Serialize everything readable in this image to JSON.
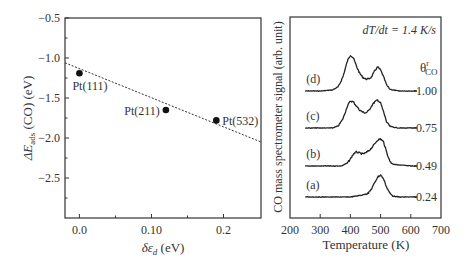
{
  "chart_data": [
    {
      "type": "scatter",
      "panel": "left",
      "title": "",
      "xlabel": "δε_d (eV)",
      "ylabel": "ΔE_ads (CO) (eV)",
      "xlim": [
        -0.02,
        0.252
      ],
      "ylim": [
        -3.0,
        -0.5
      ],
      "x_ticks": [
        0.0,
        0.1,
        0.2
      ],
      "x_tick_labels": [
        "0.0",
        "0.10",
        "0.2"
      ],
      "x_minor_ticks": [
        0.05,
        0.15
      ],
      "y_ticks": [
        -0.5,
        -1.0,
        -1.5,
        -2.0,
        -2.5
      ],
      "y_tick_labels": [
        "−0.5",
        "−1.0",
        "−1.5",
        "−2.0",
        "−2.5"
      ],
      "y_minor_ticks": [
        -0.75,
        -1.25,
        -1.75,
        -2.25,
        -2.75
      ],
      "grid": false,
      "points": [
        {
          "label": "Pt(111)",
          "x": 0.0,
          "y": -1.19
        },
        {
          "label": "Pt(211)",
          "x": 0.12,
          "y": -1.65
        },
        {
          "label": "Pt(532)",
          "x": 0.19,
          "y": -1.78
        }
      ],
      "fit_line": {
        "style": "dashed",
        "x": [
          -0.02,
          0.252
        ],
        "y": [
          -1.06,
          -2.05
        ]
      }
    },
    {
      "type": "line",
      "panel": "right",
      "title": "",
      "annotation": "dT/dt = 1.4 K/s",
      "legend_title": "θ_CO^r",
      "xlabel": "Temperature (K)",
      "ylabel": "CO mass spectrometer signal (arb. unit)",
      "xlim": [
        200,
        700
      ],
      "x_ticks": [
        200,
        300,
        400,
        500,
        600,
        700
      ],
      "x_tick_labels": [
        "200",
        "300",
        "400",
        "500",
        "600",
        "700"
      ],
      "grid": false,
      "series": [
        {
          "name": "(d)",
          "coverage": "1.00",
          "baseline_y": 91,
          "x": [
            250,
            300,
            340,
            360,
            375,
            390,
            400,
            410,
            420,
            430,
            440,
            450,
            460,
            470,
            480,
            490,
            500,
            510,
            520,
            530,
            540,
            560,
            600,
            620
          ],
          "y": [
            0,
            0,
            1,
            4,
            14,
            30,
            36,
            33,
            25,
            18,
            14,
            12,
            12,
            14,
            20,
            24,
            21,
            14,
            6,
            2,
            1,
            0,
            0,
            0
          ]
        },
        {
          "name": "(c)",
          "coverage": "0.75",
          "baseline_y": 128,
          "x": [
            250,
            300,
            340,
            360,
            375,
            390,
            400,
            410,
            420,
            430,
            440,
            450,
            460,
            470,
            480,
            490,
            500,
            510,
            520,
            530,
            540,
            560,
            600,
            620
          ],
          "y": [
            0,
            0,
            0,
            2,
            9,
            22,
            27,
            26,
            22,
            18,
            16,
            15,
            17,
            22,
            26,
            28,
            25,
            16,
            6,
            2,
            1,
            0,
            0,
            0
          ]
        },
        {
          "name": "(b)",
          "coverage": "0.49",
          "baseline_y": 166,
          "x": [
            250,
            300,
            350,
            370,
            390,
            400,
            410,
            420,
            430,
            440,
            450,
            460,
            470,
            480,
            490,
            500,
            510,
            520,
            530,
            540,
            560,
            600,
            620
          ],
          "y": [
            0,
            0,
            0,
            0,
            3,
            7,
            12,
            14,
            13,
            12,
            13,
            15,
            18,
            22,
            26,
            27,
            24,
            14,
            5,
            2,
            1,
            0,
            0
          ]
        },
        {
          "name": "(a)",
          "coverage": "0.24",
          "baseline_y": 197,
          "x": [
            250,
            300,
            350,
            400,
            420,
            440,
            460,
            470,
            480,
            490,
            500,
            510,
            520,
            530,
            540,
            560,
            600,
            620
          ],
          "y": [
            0,
            0,
            0,
            0,
            1,
            2,
            4,
            8,
            14,
            20,
            22,
            18,
            10,
            4,
            1,
            0,
            0,
            0
          ]
        }
      ]
    }
  ],
  "left_panel": {
    "ylabel_main": "ΔE",
    "ylabel_sub": "ads",
    "ylabel_rest": " (CO) (eV)",
    "xlabel_main": "δε",
    "xlabel_sub": "d",
    "xlabel_rest": " (eV)"
  },
  "right_panel": {
    "annotation": "dT/dt = 1.4 K/s",
    "theta_main": "θ",
    "theta_sup": "r",
    "theta_sub": "CO",
    "xlabel": "Temperature (K)",
    "ylabel": "CO mass spectrometer signal (arb. unit)"
  }
}
